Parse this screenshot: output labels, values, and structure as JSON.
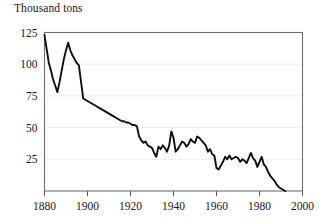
{
  "chart_data": {
    "type": "line",
    "title": "Thousand tons",
    "xlabel": "",
    "ylabel": "Thousand tons",
    "xlim": [
      1880,
      2000
    ],
    "ylim": [
      0,
      125
    ],
    "grid": true,
    "legend": "none",
    "xticks": [
      1880,
      1900,
      1920,
      1940,
      1960,
      1980,
      2000
    ],
    "yticks": [
      25,
      50,
      75,
      100,
      125
    ],
    "series": [
      {
        "name": "Landings",
        "x": [
          1880,
          1881,
          1882,
          1883,
          1884,
          1885,
          1886,
          1887,
          1888,
          1889,
          1890,
          1891,
          1892,
          1893,
          1894,
          1895,
          1896,
          1897,
          1898,
          1899,
          1900,
          1901,
          1902,
          1903,
          1904,
          1905,
          1906,
          1907,
          1908,
          1909,
          1910,
          1911,
          1912,
          1913,
          1914,
          1915,
          1916,
          1917,
          1918,
          1919,
          1920,
          1921,
          1922,
          1923,
          1924,
          1925,
          1926,
          1927,
          1928,
          1929,
          1930,
          1931,
          1932,
          1933,
          1934,
          1935,
          1936,
          1937,
          1938,
          1939,
          1940,
          1941,
          1942,
          1943,
          1944,
          1945,
          1946,
          1947,
          1948,
          1949,
          1950,
          1951,
          1952,
          1953,
          1954,
          1955,
          1956,
          1957,
          1958,
          1959,
          1960,
          1961,
          1962,
          1963,
          1964,
          1965,
          1966,
          1967,
          1968,
          1969,
          1970,
          1971,
          1972,
          1973,
          1974,
          1975,
          1976,
          1977,
          1978,
          1979,
          1980,
          1981,
          1982,
          1983,
          1984,
          1985,
          1986,
          1987,
          1988,
          1989,
          1990,
          1991,
          1992
        ],
        "values": [
          123,
          112,
          101,
          95,
          88,
          83,
          78,
          86,
          95,
          104,
          111,
          117,
          111,
          107,
          104,
          101,
          99,
          86,
          73,
          72,
          71,
          70,
          69,
          68,
          67,
          66,
          65,
          64,
          63,
          62,
          61,
          60,
          59,
          58,
          57,
          56,
          55,
          55,
          54,
          54,
          53,
          52,
          52,
          51,
          43,
          40,
          38,
          39,
          36,
          35,
          34,
          30,
          27,
          35,
          33,
          36,
          34,
          31,
          36,
          47,
          42,
          31,
          33,
          36,
          39,
          38,
          35,
          37,
          41,
          39,
          38,
          43,
          42,
          40,
          38,
          36,
          31,
          33,
          29,
          28,
          18,
          17,
          20,
          23,
          27,
          25,
          28,
          25,
          26,
          27,
          26,
          23,
          25,
          24,
          22,
          26,
          30,
          26,
          24,
          19,
          23,
          27,
          21,
          19,
          15,
          12,
          10,
          8,
          5,
          3,
          2,
          1,
          0
        ]
      }
    ]
  }
}
